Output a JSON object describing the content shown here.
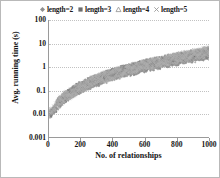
{
  "chart_data": {
    "type": "scatter",
    "title": "",
    "xlabel": "No. of relationships",
    "ylabel": "Avg. running time (s)",
    "xlim": [
      0,
      1000
    ],
    "ylim": [
      0.001,
      100
    ],
    "yscale": "log",
    "grid": true,
    "legend_position": "top",
    "xticks": [
      0,
      200,
      400,
      600,
      800,
      1000
    ],
    "yticks": [
      0.001,
      0.01,
      0.1,
      1,
      10,
      100
    ],
    "ytick_labels": [
      "0.001",
      "0.01",
      "0.1",
      "1",
      "10",
      "100"
    ],
    "xtick_labels": [
      "0",
      "200",
      "400",
      "600",
      "800",
      "1000"
    ],
    "series": [
      {
        "name": "length=2",
        "marker": "diamond",
        "color": "#8f8f8f",
        "points": [
          [
            10,
            0.009
          ],
          [
            20,
            0.011
          ],
          [
            30,
            0.014
          ],
          [
            45,
            0.019
          ],
          [
            60,
            0.026
          ],
          [
            75,
            0.034
          ],
          [
            95,
            0.045
          ],
          [
            115,
            0.058
          ],
          [
            140,
            0.075
          ],
          [
            165,
            0.094
          ],
          [
            195,
            0.12
          ],
          [
            225,
            0.15
          ],
          [
            260,
            0.19
          ],
          [
            295,
            0.24
          ],
          [
            335,
            0.3
          ],
          [
            375,
            0.37
          ],
          [
            420,
            0.46
          ],
          [
            465,
            0.57
          ],
          [
            515,
            0.7
          ],
          [
            565,
            0.86
          ],
          [
            620,
            1.05
          ],
          [
            675,
            1.28
          ],
          [
            735,
            1.55
          ],
          [
            795,
            1.88
          ],
          [
            860,
            2.25
          ],
          [
            925,
            2.7
          ],
          [
            985,
            3.15
          ]
        ]
      },
      {
        "name": "length=3",
        "marker": "square",
        "color": "#6d6d6d",
        "points": [
          [
            12,
            0.01
          ],
          [
            25,
            0.013
          ],
          [
            38,
            0.018
          ],
          [
            55,
            0.025
          ],
          [
            72,
            0.034
          ],
          [
            90,
            0.045
          ],
          [
            112,
            0.06
          ],
          [
            135,
            0.078
          ],
          [
            162,
            0.1
          ],
          [
            190,
            0.13
          ],
          [
            222,
            0.17
          ],
          [
            255,
            0.21
          ],
          [
            292,
            0.27
          ],
          [
            330,
            0.34
          ],
          [
            372,
            0.43
          ],
          [
            415,
            0.53
          ],
          [
            462,
            0.66
          ],
          [
            510,
            0.81
          ],
          [
            562,
            1.0
          ],
          [
            615,
            1.22
          ],
          [
            672,
            1.5
          ],
          [
            730,
            1.82
          ],
          [
            790,
            2.2
          ],
          [
            852,
            2.65
          ],
          [
            915,
            3.2
          ],
          [
            975,
            3.8
          ]
        ]
      },
      {
        "name": "length=4",
        "marker": "triangle",
        "color": "#9d9d9d",
        "points": [
          [
            15,
            0.012
          ],
          [
            30,
            0.016
          ],
          [
            45,
            0.022
          ],
          [
            65,
            0.031
          ],
          [
            85,
            0.042
          ],
          [
            108,
            0.056
          ],
          [
            132,
            0.074
          ],
          [
            158,
            0.096
          ],
          [
            188,
            0.125
          ],
          [
            220,
            0.16
          ],
          [
            255,
            0.21
          ],
          [
            292,
            0.27
          ],
          [
            332,
            0.34
          ],
          [
            375,
            0.43
          ],
          [
            420,
            0.54
          ],
          [
            468,
            0.68
          ],
          [
            518,
            0.85
          ],
          [
            570,
            1.05
          ],
          [
            625,
            1.3
          ],
          [
            682,
            1.6
          ],
          [
            742,
            1.95
          ],
          [
            802,
            2.38
          ],
          [
            865,
            2.9
          ],
          [
            928,
            3.5
          ],
          [
            985,
            4.2
          ]
        ]
      },
      {
        "name": "length=5",
        "marker": "cross",
        "color": "#b0b0b0",
        "points": [
          [
            18,
            0.013
          ],
          [
            35,
            0.018
          ],
          [
            52,
            0.025
          ],
          [
            72,
            0.035
          ],
          [
            95,
            0.048
          ],
          [
            120,
            0.064
          ],
          [
            148,
            0.085
          ],
          [
            178,
            0.112
          ],
          [
            210,
            0.146
          ],
          [
            245,
            0.19
          ],
          [
            283,
            0.25
          ],
          [
            323,
            0.32
          ],
          [
            366,
            0.41
          ],
          [
            412,
            0.52
          ],
          [
            460,
            0.65
          ],
          [
            512,
            0.82
          ],
          [
            565,
            1.02
          ],
          [
            622,
            1.27
          ],
          [
            680,
            1.58
          ],
          [
            740,
            1.94
          ],
          [
            802,
            2.38
          ],
          [
            866,
            2.92
          ],
          [
            930,
            3.58
          ],
          [
            990,
            4.4
          ]
        ]
      }
    ],
    "legend": [
      {
        "label": "length=2",
        "marker": "diamond"
      },
      {
        "label": "length=3",
        "marker": "square"
      },
      {
        "label": "length=4",
        "marker": "triangle"
      },
      {
        "label": "length=5",
        "marker": "cross"
      }
    ]
  }
}
